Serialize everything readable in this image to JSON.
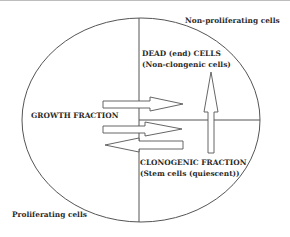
{
  "diagram": {
    "type": "cell-population-fractions",
    "colors": {
      "line": "#555555",
      "text": "#2a2a2a",
      "background": "#ffffff",
      "arrow_fill": "#ffffff"
    },
    "regions": {
      "top_right_outside": "Non-proliferating cells",
      "bottom_left_outside": "Proliferating cells"
    },
    "labels": {
      "growth_fraction": "GROWTH FRACTION",
      "dead_cells_title": "DEAD (end) CELLS",
      "dead_cells_sub": "(Non-clongenic cells)",
      "clonogenic_title": "CLONOGENIC FRACTION",
      "clonogenic_sub": "(Stem cells (quiescent))"
    },
    "arrows": [
      {
        "id": "growth-to-dead",
        "direction": "right"
      },
      {
        "id": "growth-to-clonogenic",
        "direction": "right"
      },
      {
        "id": "clonogenic-to-growth",
        "direction": "left"
      },
      {
        "id": "clonogenic-to-dead",
        "direction": "up"
      }
    ]
  }
}
